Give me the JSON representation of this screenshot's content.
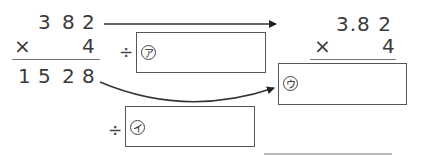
{
  "left_calc": {
    "multiplicand_digits": [
      "3",
      "8",
      "2"
    ],
    "operator": "×",
    "multiplier": "4",
    "product_digits": [
      "1",
      "5",
      "2",
      "8"
    ]
  },
  "right_calc": {
    "multiplicand": "3.8 2",
    "operator": "×",
    "multiplier": "4"
  },
  "boxes": {
    "a": {
      "prefix": "÷",
      "marker": "ア"
    },
    "i": {
      "prefix": "÷",
      "marker": "イ"
    },
    "u": {
      "prefix": "",
      "marker": "ウ"
    }
  },
  "colors": {
    "ink": "#3a3a3a",
    "line": "#555555"
  }
}
